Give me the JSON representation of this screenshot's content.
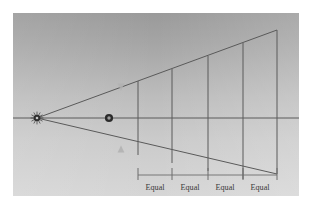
{
  "figure": {
    "panel": {
      "x": 13,
      "y": 13,
      "width": 286,
      "height": 183,
      "gradient_top_color": "#9c9c9c",
      "gradient_mid_color": "#bdbdbd",
      "gradient_bottom_color": "#d4d4d4",
      "border_color": "#ffffff"
    },
    "line_color": "#5a5a5a",
    "accent_marker_color": "#2b2b2b",
    "guide_marker_color": "#b0b0b0"
  },
  "elements": {
    "horizon_line": {
      "name": "horizon-line",
      "x1": 13,
      "y1": 118,
      "x2": 299,
      "y2": 118
    },
    "vanishing_point": {
      "name": "vanishing-point",
      "cx": 37,
      "cy": 118,
      "marker": "star-burst-dot"
    },
    "station_point_dot": {
      "name": "measuring-point-dot",
      "cx": 109,
      "cy": 118,
      "marker": "filled-circle"
    },
    "upper_convergence_line": {
      "name": "upper-convergence-line",
      "x1": 37,
      "y1": 118,
      "x2": 277,
      "y2": 30
    },
    "lower_convergence_line": {
      "name": "lower-convergence-line",
      "x1": 37,
      "y1": 118,
      "x2": 277,
      "y2": 174
    },
    "upper_guide_marker": {
      "name": "upper-guide-arrow-marker",
      "cx": 121,
      "cy": 87
    },
    "lower_guide_marker": {
      "name": "lower-guide-arrow-marker",
      "cx": 121,
      "cy": 149
    },
    "vertical_lines": [
      {
        "name": "vertical-line-1",
        "x": 138,
        "y_top": 81,
        "y_bottom": 155
      },
      {
        "name": "vertical-line-2",
        "x": 172,
        "y_top": 69,
        "y_bottom": 163
      },
      {
        "name": "vertical-line-3",
        "x": 208,
        "y_top": 56,
        "y_bottom": 171
      },
      {
        "name": "vertical-line-4",
        "x": 243,
        "y_top": 43,
        "y_bottom": 179
      },
      {
        "name": "vertical-line-5",
        "x": 277,
        "y_top": 30,
        "y_bottom": 174
      }
    ],
    "measure_baseline": {
      "name": "measure-baseline",
      "y": 175,
      "x1": 138,
      "x2": 277
    },
    "measure_ticks": [
      {
        "name": "measure-tick-1",
        "x": 138,
        "y_top": 168,
        "y_bottom": 180
      },
      {
        "name": "measure-tick-2",
        "x": 172,
        "y_top": 168,
        "y_bottom": 180
      },
      {
        "name": "measure-tick-3",
        "x": 208,
        "y_top": 168,
        "y_bottom": 180
      },
      {
        "name": "measure-tick-4",
        "x": 243,
        "y_top": 168,
        "y_bottom": 180
      },
      {
        "name": "measure-tick-5",
        "x": 277,
        "y_top": 168,
        "y_bottom": 180
      }
    ]
  },
  "labels": {
    "equal_intervals": [
      {
        "text": "Equal",
        "x": 155,
        "y": 190
      },
      {
        "text": "Equal",
        "x": 190,
        "y": 190
      },
      {
        "text": "Equal",
        "x": 225,
        "y": 190
      },
      {
        "text": "Equal",
        "x": 260,
        "y": 190
      }
    ]
  }
}
